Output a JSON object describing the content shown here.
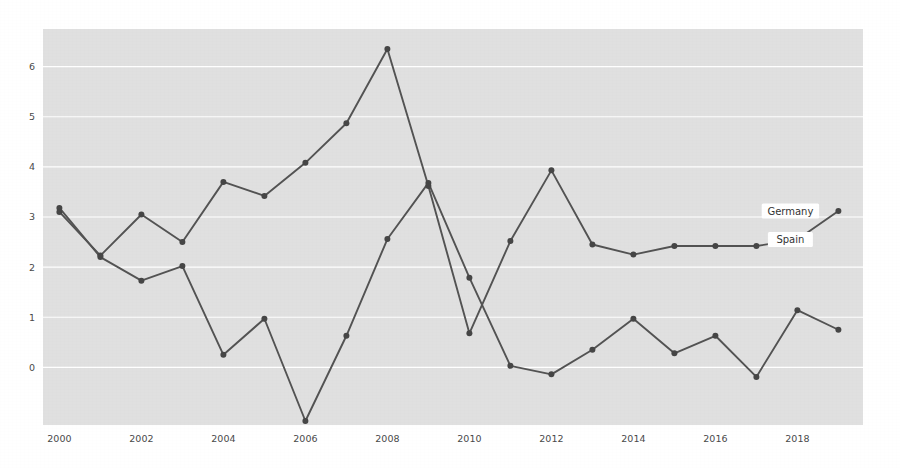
{
  "chart_data": {
    "type": "line",
    "title": "",
    "subtitle": "",
    "xlabel": "",
    "ylabel": "",
    "x": [
      2000,
      2001,
      2002,
      2003,
      2004,
      2005,
      2006,
      2007,
      2008,
      2009,
      2010,
      2011,
      2012,
      2013,
      2014,
      2015,
      2016,
      2017,
      2018,
      2019
    ],
    "xtick_labels": [
      "2000",
      "2002",
      "2004",
      "2006",
      "2008",
      "2010",
      "2012",
      "2014",
      "2016",
      "2018"
    ],
    "xtick_values": [
      2000,
      2002,
      2004,
      2006,
      2008,
      2010,
      2012,
      2014,
      2016,
      2018
    ],
    "ytick_labels": [
      "0",
      "1",
      "2",
      "3",
      "4",
      "5",
      "6"
    ],
    "ytick_values": [
      0,
      1,
      2,
      3,
      4,
      5,
      6
    ],
    "xlim": [
      1999.6,
      2019.6
    ],
    "ylim": [
      -1.15,
      6.75
    ],
    "grid": "horizontal",
    "legend_position": "inline-right-end",
    "series": [
      {
        "name": "Germany",
        "color": "#535353",
        "label_position": "end",
        "values": [
          3.18,
          2.2,
          1.73,
          2.02,
          0.25,
          0.97,
          -1.07,
          0.63,
          2.56,
          3.68,
          1.79,
          0.03,
          -0.14,
          0.35,
          0.97,
          0.28,
          0.63,
          -0.19,
          1.14,
          0.75
        ]
      },
      {
        "name": "Spain",
        "color": "#535353",
        "label_position": "end",
        "values": [
          3.1,
          2.23,
          3.05,
          2.5,
          3.7,
          3.42,
          4.08,
          4.87,
          6.35,
          3.62,
          0.68,
          2.52,
          3.93,
          2.45,
          2.25,
          2.42,
          2.42,
          2.42,
          2.55,
          3.12
        ]
      }
    ],
    "final_labels": [
      {
        "name": "Germany",
        "x": 2019,
        "y": 3.12
      },
      {
        "name": "Spain",
        "x": 2019,
        "y": 2.55
      }
    ],
    "background_color": "#e0e0e0",
    "gridline_color": "#ffffff",
    "figure_background": "#ffffff",
    "marker": "circle",
    "marker_size": 3
  }
}
